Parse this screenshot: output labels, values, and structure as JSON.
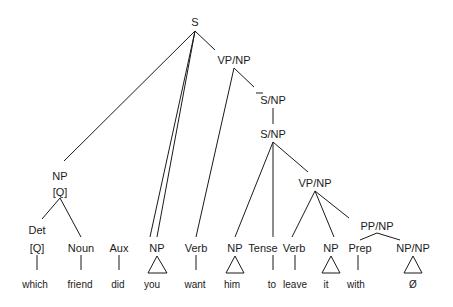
{
  "diagram": {
    "type": "syntax-tree",
    "nodes": {
      "S": "S",
      "VP_NP_top": "VP/NP",
      "Sbar_NP": "S/NP",
      "S_NP": "S/NP",
      "NP_Q": "NP",
      "NP_Q_feature": "[Q]",
      "Det": "Det",
      "Det_feature": "[Q]",
      "Noun": "Noun",
      "Aux": "Aux",
      "NP_you": "NP",
      "Verb_want": "Verb",
      "NP_him": "NP",
      "Tense": "Tense",
      "VP_NP_low": "VP/NP",
      "Verb_leave": "Verb",
      "NP_it": "NP",
      "PP_NP": "PP/NP",
      "Prep": "Prep",
      "NP_NP": "NP/NP"
    },
    "words": {
      "which": "which",
      "friend": "friend",
      "did": "did",
      "you": "you",
      "want": "want",
      "him": "him",
      "to": "to",
      "leave": "leave",
      "it": "it",
      "with": "with",
      "empty": "Ø"
    }
  }
}
